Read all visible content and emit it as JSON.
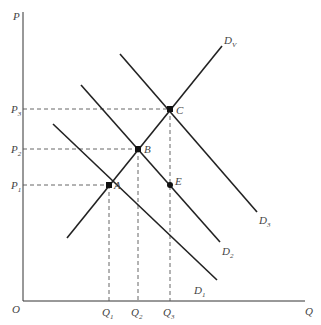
{
  "diagram": {
    "axes": {
      "y_label": "P",
      "x_label": "Q",
      "origin_label": "O"
    },
    "price_levels": [
      {
        "label": "P",
        "sub": "3",
        "y": 109
      },
      {
        "label": "P",
        "sub": "2",
        "y": 149
      },
      {
        "label": "P",
        "sub": "1",
        "y": 185
      }
    ],
    "quantity_levels": [
      {
        "label": "Q",
        "sub": "1",
        "x": 109
      },
      {
        "label": "Q",
        "sub": "2",
        "x": 138
      },
      {
        "label": "Q",
        "sub": "3",
        "x": 170
      }
    ],
    "curves": [
      {
        "name": "D",
        "sub": "1",
        "from": [
          53,
          124
        ],
        "to": [
          217,
          280
        ]
      },
      {
        "name": "D",
        "sub": "2",
        "from": [
          81,
          85
        ],
        "to": [
          220,
          242
        ]
      },
      {
        "name": "D",
        "sub": "3",
        "from": [
          120,
          54
        ],
        "to": [
          257,
          212
        ]
      },
      {
        "name": "D",
        "sub": "V",
        "from": [
          67,
          238
        ],
        "to": [
          222,
          46
        ]
      }
    ],
    "points": [
      {
        "label": "A",
        "x": 109,
        "y": 185
      },
      {
        "label": "B",
        "x": 138,
        "y": 149
      },
      {
        "label": "C",
        "x": 170,
        "y": 109
      },
      {
        "label": "E",
        "x": 170,
        "y": 185
      }
    ],
    "colors": {
      "line": "#222222",
      "dash": "#555555",
      "text": "#444444"
    }
  }
}
